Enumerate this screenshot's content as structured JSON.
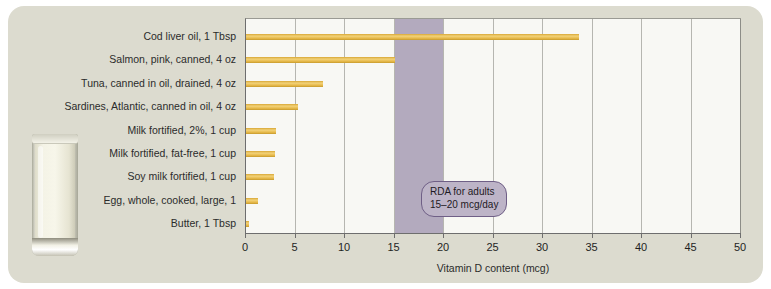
{
  "chart_data": {
    "type": "bar",
    "orientation": "horizontal",
    "title": "",
    "xlabel": "Vitamin D content (mcg)",
    "ylabel": "",
    "xlim": [
      0,
      50
    ],
    "xticks": [
      0,
      5,
      10,
      15,
      20,
      25,
      30,
      35,
      40,
      45,
      50
    ],
    "grid": true,
    "legend": "none",
    "categories": [
      "Cod liver oil, 1 Tbsp",
      "Salmon, pink, canned, 4 oz",
      "Tuna, canned in oil, drained, 4 oz",
      "Sardines, Atlantic, canned in oil, 4 oz",
      "Milk fortified, 2%, 1 cup",
      "Milk fortified, fat-free, 1 cup",
      "Soy milk fortified, 1 cup",
      "Egg, whole, cooked, large, 1",
      "Butter, 1 Tbsp"
    ],
    "values": [
      33.6,
      15.0,
      7.8,
      5.3,
      3.0,
      2.9,
      2.8,
      1.2,
      0.3
    ],
    "bar_color": "#e8bb4c",
    "annotations": [
      {
        "name": "rda-band",
        "type": "vertical-span",
        "x_start": 15,
        "x_end": 20,
        "color": "#b3aabe",
        "label_line1": "RDA for adults",
        "label_line2": "15–20 mcg/day"
      }
    ]
  },
  "panel": {
    "background_color": "#dcdbcf"
  },
  "photo": {
    "caption": "glass-of-milk-photo"
  },
  "axis": {
    "ticks": [
      "0",
      "5",
      "10",
      "15",
      "20",
      "25",
      "30",
      "35",
      "40",
      "45",
      "50"
    ],
    "xlabel": "Vitamin D content (mcg)"
  },
  "callout": {
    "line1": "RDA for adults",
    "line2": "15–20 mcg/day"
  }
}
